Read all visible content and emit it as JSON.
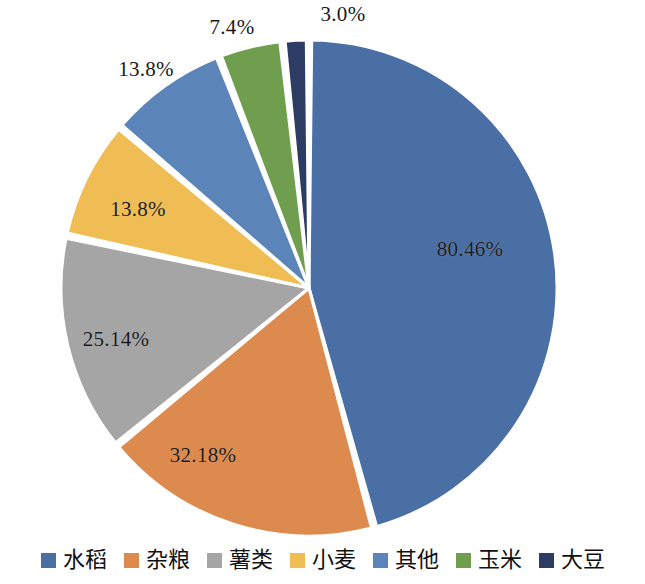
{
  "chart_data": {
    "type": "pie",
    "title": "",
    "subtitle": "",
    "xlabel": "",
    "ylabel": "",
    "grid": false,
    "legend_position": "bottom",
    "start_angle_deg": 0,
    "direction": "clockwise",
    "center": {
      "x": 309,
      "y": 288
    },
    "radius": 248,
    "slice_gap": true,
    "categories": [
      "水稻",
      "杂粮",
      "薯类",
      "小麦",
      "其他",
      "玉米",
      "大豆"
    ],
    "values": [
      80.46,
      32.18,
      25.14,
      13.8,
      13.8,
      7.4,
      3.0
    ],
    "labels": [
      "80.46%",
      "32.18%",
      "25.14%",
      "13.8%",
      "13.8%",
      "7.4%",
      "3.0%"
    ],
    "colors": [
      "#4a6fa5",
      "#dd8a4f",
      "#a5a5a5",
      "#f0bd55",
      "#5b84b8",
      "#6f9e4f",
      "#2d3c63"
    ],
    "slices": [
      {
        "name": "水稻",
        "value": 80.46,
        "label": "80.46%",
        "color": "#4a6fa5",
        "label_x": 470,
        "label_y": 249,
        "label_placement": "inside"
      },
      {
        "name": "杂粮",
        "value": 32.18,
        "label": "32.18%",
        "color": "#dd8a4f",
        "label_x": 203,
        "label_y": 455,
        "label_placement": "inside"
      },
      {
        "name": "薯类",
        "value": 25.14,
        "label": "25.14%",
        "color": "#a5a5a5",
        "label_x": 116,
        "label_y": 339,
        "label_placement": "inside"
      },
      {
        "name": "小麦",
        "value": 13.8,
        "label": "13.8%",
        "color": "#f0bd55",
        "label_x": 138,
        "label_y": 209,
        "label_placement": "inside"
      },
      {
        "name": "其他",
        "value": 13.8,
        "label": "13.8%",
        "color": "#5b84b8",
        "label_x": 146,
        "label_y": 69,
        "label_placement": "outside"
      },
      {
        "name": "玉米",
        "value": 7.4,
        "label": "7.4%",
        "color": "#6f9e4f",
        "label_x": 232,
        "label_y": 27,
        "label_placement": "outside"
      },
      {
        "name": "大豆",
        "value": 3.0,
        "label": "3.0%",
        "color": "#2d3c63",
        "label_x": 343,
        "label_y": 14,
        "label_placement": "outside"
      }
    ]
  },
  "legend": {
    "items": [
      {
        "label": "水稻",
        "color": "#4a6fa5"
      },
      {
        "label": "杂粮",
        "color": "#dd8a4f"
      },
      {
        "label": "薯类",
        "color": "#a5a5a5"
      },
      {
        "label": "小麦",
        "color": "#f0bd55"
      },
      {
        "label": "其他",
        "color": "#5b84b8"
      },
      {
        "label": "玉米",
        "color": "#6f9e4f"
      },
      {
        "label": "大豆",
        "color": "#2d3c63"
      }
    ]
  }
}
